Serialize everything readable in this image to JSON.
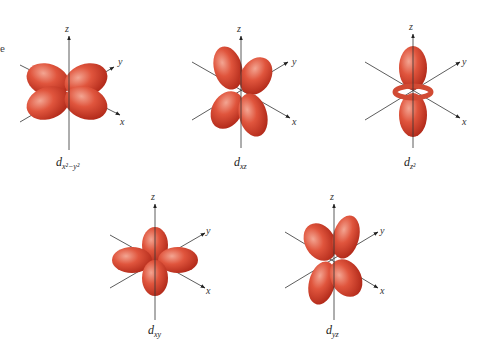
{
  "figure": {
    "edge_text": "e",
    "lobe_color": "#d9402c",
    "lobe_highlight": "#f09a86",
    "axis_color": "#333333",
    "orbitals": [
      {
        "id": "dx2-y2",
        "label_main": "d",
        "label_sub": "x²−y²",
        "axes": {
          "z": "z",
          "y": "y",
          "x": "x"
        }
      },
      {
        "id": "dxz",
        "label_main": "d",
        "label_sub": "xz",
        "axes": {
          "z": "z",
          "y": "y",
          "x": "x"
        }
      },
      {
        "id": "dz2",
        "label_main": "d",
        "label_sub": "z²",
        "axes": {
          "z": "z",
          "y": "y",
          "x": "x"
        }
      },
      {
        "id": "dxy",
        "label_main": "d",
        "label_sub": "xy",
        "axes": {
          "z": "z",
          "y": "y",
          "x": "x"
        }
      },
      {
        "id": "dyz",
        "label_main": "d",
        "label_sub": "yz",
        "axes": {
          "z": "z",
          "y": "y",
          "x": "x"
        }
      }
    ]
  }
}
